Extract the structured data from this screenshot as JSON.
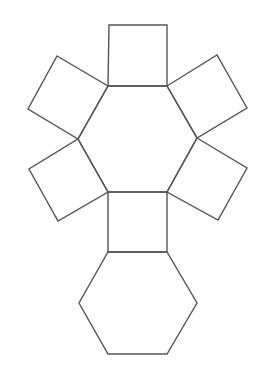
{
  "figure": {
    "width": 259,
    "height": 371,
    "background": "#ffffff",
    "stroke_color": "#555555",
    "stroke_width": 1.4,
    "shapes": [
      {
        "name": "top-hexagon",
        "type": "hexagon",
        "points": "108,86 167,86 197,138 167,192 108,192 78,139"
      },
      {
        "name": "square-top",
        "type": "square",
        "points": "109,25 167,25 167,86 108,86"
      },
      {
        "name": "square-upper-left",
        "type": "square",
        "points": "57,56 108,86 78,139 28,109"
      },
      {
        "name": "square-upper-right",
        "type": "square",
        "points": "167,86 217,55 247,108 197,138"
      },
      {
        "name": "square-lower-left",
        "type": "square",
        "points": "78,139 108,192 58,221 29,169"
      },
      {
        "name": "square-lower-right",
        "type": "square",
        "points": "197,138 247,168 218,220 167,192"
      },
      {
        "name": "square-bottom",
        "type": "square",
        "points": "108,192 167,192 167,252 108,252"
      },
      {
        "name": "bottom-hexagon",
        "type": "hexagon",
        "points": "108,252 167,252 197,303 167,354 108,354 79,303"
      }
    ]
  }
}
